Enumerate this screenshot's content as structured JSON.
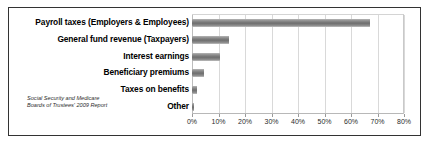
{
  "chart_data": {
    "type": "bar",
    "orientation": "horizontal",
    "title": "",
    "xlabel": "",
    "ylabel": "",
    "categories": [
      "Payroll taxes (Employers & Employees)",
      "General fund revenue (Taxpayers)",
      "Interest earnings",
      "Beneficiary premiums",
      "Taxes on benefits",
      "Other"
    ],
    "values": [
      67,
      14,
      10.5,
      4.5,
      2,
      0.8
    ],
    "value_unit": "%",
    "xlim": [
      0,
      80
    ],
    "xticks": [
      0,
      10,
      20,
      30,
      40,
      50,
      60,
      70,
      80
    ],
    "xtick_labels": [
      "0%",
      "10%",
      "20%",
      "30%",
      "40%",
      "50%",
      "60%",
      "70%",
      "80%"
    ],
    "grid": "vertical",
    "legend": "none",
    "bar_color": "#7a7a7a",
    "annotations": [
      "Social Security and Medicare",
      "Boards of Trustees' 2009 Report"
    ]
  },
  "source_note": {
    "line1": "Social Security and Medicare",
    "line2": "Boards of Trustees' 2009 Report"
  },
  "style": {
    "frame_border_color": "#333333",
    "gridline_color": "#d9d9d9",
    "background": "#ffffff"
  }
}
